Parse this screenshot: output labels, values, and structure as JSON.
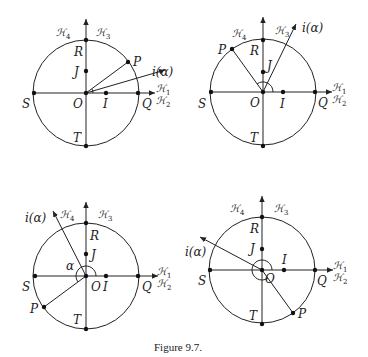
{
  "figure": {
    "caption": "Figure 9.7.",
    "labels": {
      "S": "S",
      "Q": "Q",
      "R": "R",
      "T": "T",
      "O": "O",
      "I": "I",
      "J": "J",
      "P": "P",
      "i_alpha": "i(α)",
      "alpha": "α",
      "H1": "ℋ",
      "H1_sub": "1",
      "H2": "ℋ",
      "H2_sub": "2",
      "H3": "ℋ",
      "H3_sub": "3",
      "H4": "ℋ",
      "H4_sub": "4"
    },
    "panels": [
      {
        "name": "top-left",
        "description": "P in first quadrant, i(α) ray slightly below OP"
      },
      {
        "name": "top-right",
        "description": "P in second quadrant, i(α) ray in first quadrant"
      },
      {
        "name": "bottom-left",
        "description": "P in third quadrant, i(α) ray in second quadrant, angle α marked"
      },
      {
        "name": "bottom-right",
        "description": "P in fourth quadrant, i(α) ray in second quadrant, full-turn angle marked"
      }
    ]
  }
}
